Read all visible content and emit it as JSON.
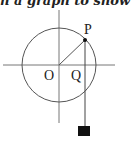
{
  "caption": "n a graph to show th",
  "diagram": {
    "labels": {
      "P": "P",
      "O": "O",
      "Q": "Q"
    },
    "center": [
      59,
      65
    ],
    "radius": 37,
    "point_P": [
      85,
      40
    ],
    "colors": {
      "stroke": "#555555",
      "block": "#111111"
    }
  }
}
